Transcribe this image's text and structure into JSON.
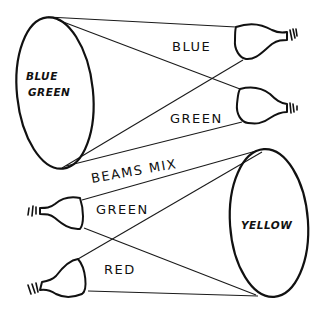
{
  "diagram": {
    "top": {
      "screen_label_line1": "BLUE",
      "screen_label_line2": "GREEN",
      "beam_labels": [
        "BLUE",
        "GREEN"
      ],
      "light_sources": [
        "blue-projector",
        "green-projector"
      ]
    },
    "middle": {
      "label": "BEAMS MIX"
    },
    "bottom": {
      "screen_label": "YELLOW",
      "beam_labels": [
        "GREEN",
        "RED"
      ],
      "light_sources": [
        "green-projector",
        "red-projector"
      ]
    },
    "colors": {
      "ink": "#111111",
      "paper": "#ffffff"
    },
    "icons": {
      "screen": "hatched-ellipse-screen",
      "projector": "spotlight-bulb-icon"
    }
  }
}
